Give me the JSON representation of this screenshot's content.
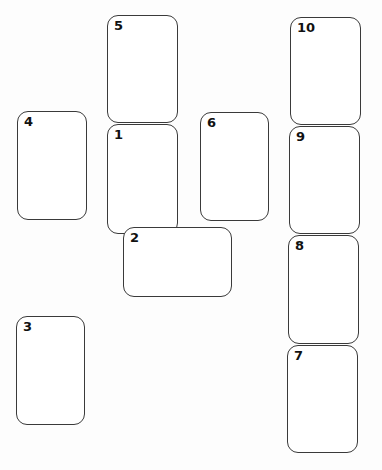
{
  "diagram": {
    "type": "card-spread-layout",
    "cards": [
      {
        "number": "1",
        "orientation": "upright",
        "left": 107,
        "top": 124,
        "width": 71,
        "height": 110,
        "z": 1
      },
      {
        "number": "2",
        "orientation": "crossing",
        "left": 123,
        "top": 227,
        "width": 109,
        "height": 70,
        "z": 3
      },
      {
        "number": "3",
        "orientation": "upright",
        "left": 16,
        "top": 316,
        "width": 69,
        "height": 109,
        "z": 1
      },
      {
        "number": "4",
        "orientation": "upright",
        "left": 17,
        "top": 111,
        "width": 70,
        "height": 109,
        "z": 1
      },
      {
        "number": "5",
        "orientation": "upright",
        "left": 107,
        "top": 15,
        "width": 71,
        "height": 108,
        "z": 2
      },
      {
        "number": "6",
        "orientation": "upright",
        "left": 200,
        "top": 112,
        "width": 69,
        "height": 109,
        "z": 1
      },
      {
        "number": "7",
        "orientation": "upright",
        "left": 287,
        "top": 345,
        "width": 71,
        "height": 108,
        "z": 1
      },
      {
        "number": "8",
        "orientation": "upright",
        "left": 288,
        "top": 235,
        "width": 71,
        "height": 109,
        "z": 2
      },
      {
        "number": "9",
        "orientation": "upright",
        "left": 289,
        "top": 126,
        "width": 71,
        "height": 108,
        "z": 3
      },
      {
        "number": "10",
        "orientation": "upright",
        "left": 290,
        "top": 17,
        "width": 71,
        "height": 108,
        "z": 4
      }
    ]
  },
  "colors": {
    "border": "#3a3a3a",
    "label": "#111111",
    "background": "#ffffff"
  }
}
